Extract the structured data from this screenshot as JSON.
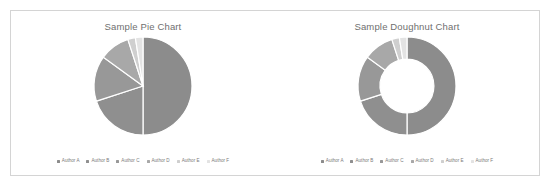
{
  "panel": {
    "background": "#ffffff",
    "border_color": "#d4d4d4"
  },
  "charts": [
    {
      "name": "pie",
      "title": "Sample Pie Chart",
      "legend": [
        {
          "label": "Author A",
          "color": "#8c8c8c"
        },
        {
          "label": "Author B",
          "color": "#8f8f8f"
        },
        {
          "label": "Author C",
          "color": "#989898"
        },
        {
          "label": "Author D",
          "color": "#a8a8a8"
        },
        {
          "label": "Author E",
          "color": "#cfcfcf"
        },
        {
          "label": "Author F",
          "color": "#e3e3e3"
        }
      ]
    },
    {
      "name": "doughnut",
      "title": "Sample Doughnut Chart",
      "legend": [
        {
          "label": "Author A",
          "color": "#8c8c8c"
        },
        {
          "label": "Author B",
          "color": "#8f8f8f"
        },
        {
          "label": "Author C",
          "color": "#989898"
        },
        {
          "label": "Author D",
          "color": "#a8a8a8"
        },
        {
          "label": "Author E",
          "color": "#cfcfcf"
        },
        {
          "label": "Author F",
          "color": "#e3e3e3"
        }
      ]
    }
  ],
  "chart_data": [
    {
      "type": "pie",
      "title": "Sample Pie Chart",
      "xlabel": "",
      "ylabel": "",
      "legend_position": "bottom",
      "grid": false,
      "start_angle_deg": 0,
      "direction": "clockwise",
      "categories": [
        "Author A",
        "Author B",
        "Author C",
        "Author D",
        "Author E",
        "Author F"
      ],
      "values": [
        50,
        20,
        15,
        10,
        2.5,
        2.5
      ],
      "colors": [
        "#8c8c8c",
        "#8f8f8f",
        "#989898",
        "#a8a8a8",
        "#cfcfcf",
        "#e3e3e3"
      ],
      "slice_gap_color": "#ffffff"
    },
    {
      "type": "pie",
      "title": "Sample Doughnut Chart",
      "xlabel": "",
      "ylabel": "",
      "legend_position": "bottom",
      "grid": false,
      "hole_ratio": 0.55,
      "start_angle_deg": 0,
      "direction": "clockwise",
      "categories": [
        "Author A",
        "Author B",
        "Author C",
        "Author D",
        "Author E",
        "Author F"
      ],
      "values": [
        50,
        20,
        15,
        10,
        2.5,
        2.5
      ],
      "colors": [
        "#8c8c8c",
        "#8f8f8f",
        "#989898",
        "#a8a8a8",
        "#cfcfcf",
        "#e3e3e3"
      ],
      "slice_gap_color": "#ffffff"
    }
  ]
}
